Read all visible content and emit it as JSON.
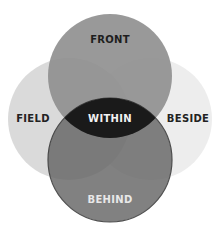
{
  "diagram": {
    "type": "venn",
    "circles": [
      {
        "id": "field",
        "label": "FIELD",
        "color": "#d6d6d6",
        "label_color": "#222222"
      },
      {
        "id": "beside",
        "label": "BESIDE",
        "color": "#ebebeb",
        "label_color": "#222222"
      },
      {
        "id": "front",
        "label": "FRONT",
        "color": "#8e8e8e",
        "label_color": "#1e1e1e"
      },
      {
        "id": "behind",
        "label": "BEHIND",
        "color": "#666666",
        "label_color": "#e8e8e8",
        "outline": "#2a2a2a"
      }
    ],
    "center": {
      "label": "WITHIN",
      "color": "#1a1a1a",
      "label_color": "#f2f2f2"
    }
  }
}
